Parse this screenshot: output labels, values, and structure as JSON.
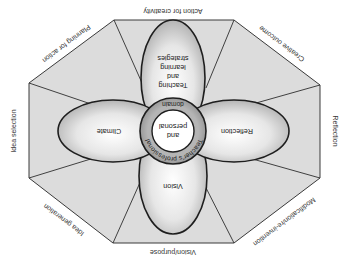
{
  "diagram": {
    "orientation": "rotated-180",
    "outer_octagon": {
      "fill": "#dcdcdc",
      "stroke": "#333333",
      "segments": [
        {
          "id": "top",
          "label": "Action for creativity"
        },
        {
          "id": "top-right",
          "label": "Planning for action"
        },
        {
          "id": "right",
          "label": "Idea selection"
        },
        {
          "id": "bottom-right",
          "label": "Idea generation"
        },
        {
          "id": "bottom",
          "label": "Vision/purpose"
        },
        {
          "id": "bottom-left",
          "label": "Modification/re-invention"
        },
        {
          "id": "left",
          "label": "Reflection"
        },
        {
          "id": "top-left",
          "label": "Creative outcome"
        }
      ]
    },
    "petals": [
      {
        "id": "top",
        "lines": [
          "Teaching",
          "and",
          "learning",
          "strategies"
        ]
      },
      {
        "id": "right",
        "lines": [
          "Climate"
        ]
      },
      {
        "id": "bottom",
        "lines": [
          "Vision"
        ]
      },
      {
        "id": "left",
        "lines": [
          "Reflection"
        ]
      }
    ],
    "ring": {
      "label": "Teacher's professional",
      "label_bottom": "domain",
      "fill": "#9a9a9a"
    },
    "core": {
      "lines": [
        "and",
        "personal"
      ],
      "fill": "#ffffff"
    }
  }
}
